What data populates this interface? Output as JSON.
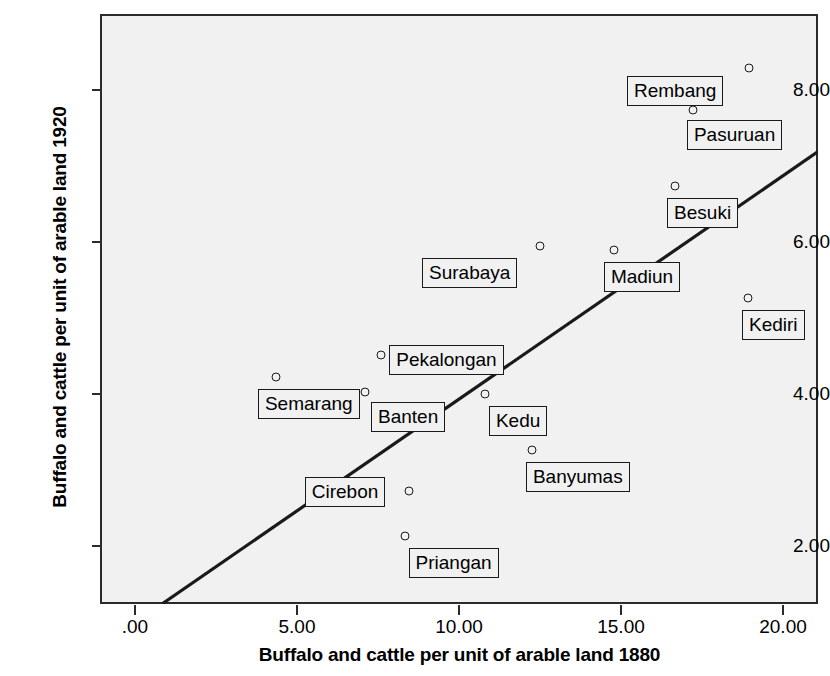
{
  "chart_data": {
    "type": "scatter",
    "title": "",
    "xlabel": "Buffalo and cattle per unit of arable land 1880",
    "ylabel": "Buffalo and cattle per unit of arable land 1920",
    "xlim": [
      -1.08,
      21.08
    ],
    "ylim": [
      1.24,
      9.0
    ],
    "grid": false,
    "legend": null,
    "xticks": [
      ".00",
      "5.00",
      "10.00",
      "15.00",
      "20.00"
    ],
    "xtick_values": [
      0.0,
      5.0,
      10.0,
      15.0,
      20.0
    ],
    "yticks": [
      "2.00",
      "4.00",
      "6.00",
      "8.00"
    ],
    "ytick_values": [
      2.0,
      4.0,
      6.0,
      8.0
    ],
    "points": [
      {
        "label": "Rembang",
        "x": 18.95,
        "y": 8.29,
        "label_dx": -122,
        "label_dy": 8
      },
      {
        "label": "Pasuruan",
        "x": 17.22,
        "y": 7.74,
        "label_dx": -6,
        "label_dy": 10
      },
      {
        "label": "Besuki",
        "x": 16.67,
        "y": 6.74,
        "label_dx": -8,
        "label_dy": 12
      },
      {
        "label": "Surabaya",
        "x": 12.5,
        "y": 5.95,
        "label_dx": -118,
        "label_dy": 12
      },
      {
        "label": "Madiun",
        "x": 14.78,
        "y": 5.9,
        "label_dx": -10,
        "label_dy": 12
      },
      {
        "label": "Kediri",
        "x": 18.92,
        "y": 5.26,
        "label_dx": -6,
        "label_dy": 12
      },
      {
        "label": "Pekalongan",
        "x": 7.6,
        "y": 4.52,
        "label_dx": 8,
        "label_dy": -10
      },
      {
        "label": "Semarang",
        "x": 4.35,
        "y": 4.22,
        "label_dx": -18,
        "label_dy": 12
      },
      {
        "label": "Banten",
        "x": 7.1,
        "y": 4.03,
        "label_dx": 6,
        "label_dy": 10
      },
      {
        "label": "Kedu",
        "x": 10.8,
        "y": 4.0,
        "label_dx": 4,
        "label_dy": 12
      },
      {
        "label": "Banyumas",
        "x": 12.25,
        "y": 3.26,
        "label_dx": -6,
        "label_dy": 12
      },
      {
        "label": "Cirebon",
        "x": 8.45,
        "y": 2.72,
        "label_dx": -104,
        "label_dy": -14
      },
      {
        "label": "Priangan",
        "x": 8.32,
        "y": 2.13,
        "label_dx": 4,
        "label_dy": 12
      }
    ],
    "fit_line": {
      "x_start": 0.83,
      "y_start": 1.24,
      "x_end": 21.08,
      "y_end": 7.19,
      "color": "#1a1a1a",
      "width": 3.2
    },
    "plot_background": "#f1f1f1",
    "frame_color": "#2b2b2b"
  }
}
